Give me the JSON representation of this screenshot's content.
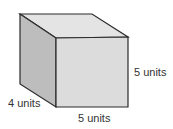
{
  "diagram": {
    "type": "rectangular-prism",
    "colors": {
      "top_face": "#e4e4e4",
      "left_face": "#bdbdbd",
      "front_face": "#dcdcdc",
      "edge": "#2a2a2a"
    },
    "labels": {
      "height": "5 units",
      "depth": "4 units",
      "width": "5 units"
    }
  }
}
